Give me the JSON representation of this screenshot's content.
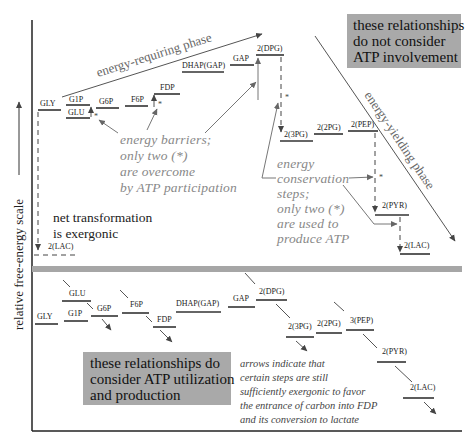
{
  "axis": {
    "ylabel": "relative free-energy scale"
  },
  "top_panel": {
    "info_box": [
      "these relationships",
      "do not consider",
      "ATP involvement"
    ],
    "phase_requiring": "energy-requiring phase",
    "phase_yielding": "energy-yielding phase",
    "levels": {
      "gly": "GLY",
      "g1p": "G1P",
      "glu": "GLU",
      "g6p": "G6P",
      "f6p": "F6P",
      "fdp": "FDP",
      "dhap": "DHAP(GAP)",
      "gap": "GAP",
      "dpg": "2(DPG)",
      "pg3": "2(3PG)",
      "pg2": "2(2PG)",
      "pep": "2(PEP)",
      "pyr": "2(PYR)",
      "lac": "2(LAC)",
      "lac_left": "2(LAC)"
    },
    "star": "*",
    "barriers_note": [
      "energy barriers;",
      "only two (*)",
      "are overcome",
      "by ATP participation"
    ],
    "conservation_note": [
      "energy",
      "conservation",
      "steps;",
      "only two (*)",
      "are used to",
      "produce ATP"
    ],
    "net_note": [
      "net transformation",
      "is exergonic"
    ]
  },
  "bottom_panel": {
    "info_box": [
      "these relationships do",
      "consider ATP utilization",
      "and production"
    ],
    "levels": {
      "gly": "GLY",
      "glu": "GLU",
      "g1p": "G1P",
      "g6p": "G6P",
      "f6p": "F6P",
      "fdp": "FDP",
      "dhap": "DHAP(GAP)",
      "gap": "GAP",
      "dpg": "2(DPG)",
      "pg3": "2(3PG)",
      "pg2": "2(2PG)",
      "pep": "3(PEP)",
      "pyr": "2(PYR)",
      "lac": "2(LAC)"
    },
    "arrows_note": [
      "arrows indicate that",
      "certain steps are still",
      "sufficiently exergonic to favor",
      "the entrance of carbon into FDP",
      "and its conversion to lactate"
    ]
  },
  "colors": {
    "info_box_bg": "#a9a9a9",
    "divider": "#a6a6a6",
    "note_text": "#888888"
  }
}
